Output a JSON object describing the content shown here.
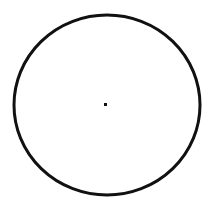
{
  "diagram": {
    "type": "circle-with-center-point",
    "circle": {
      "cx": 107,
      "cy": 105,
      "rx": 93,
      "ry": 90,
      "stroke": "#111111",
      "stroke_width": 3
    },
    "center_point": {
      "x": 104,
      "y": 103,
      "size": 3,
      "color": "#111111"
    },
    "background": "#ffffff"
  }
}
